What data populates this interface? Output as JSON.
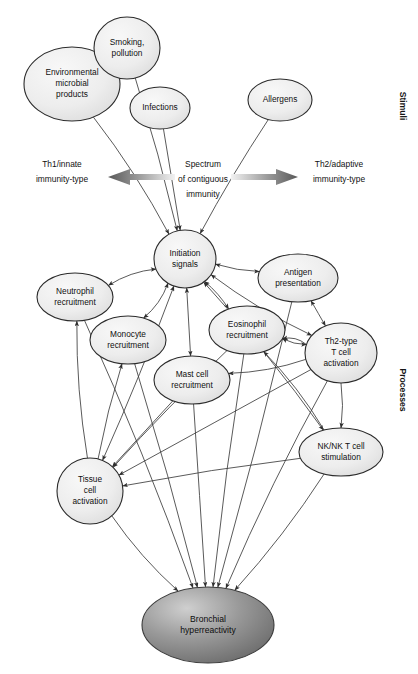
{
  "figure": {
    "background_color": "#ffffff",
    "node_fill": "#ececec",
    "node_stroke": "#2b2b2b",
    "outcome_fill_dark": "#6f6f6f",
    "outcome_fill_light": "#c9c9c9",
    "edge_color": "#3c3c3c"
  },
  "side_labels": {
    "stimuli": "Stimuli",
    "processes": "Processes"
  },
  "spectrum": {
    "left_label_line1": "Th1/innate",
    "left_label_line2": "immunity-type",
    "center_label_line1": "Spectrum",
    "center_label_line2": "of contiguous",
    "center_label_line3": "immunity",
    "right_label_line1": "Th2/adaptive",
    "right_label_line2": "immunity-type"
  },
  "nodes": {
    "environmental": {
      "lines": [
        "Environmental",
        "microbial",
        "products"
      ],
      "cx": 72,
      "cy": 84,
      "rx": 48,
      "ry": 37
    },
    "smoking": {
      "lines": [
        "Smoking,",
        "pollution"
      ],
      "cx": 127,
      "cy": 48,
      "rx": 33,
      "ry": 31
    },
    "infections": {
      "lines": [
        "Infections"
      ],
      "cx": 160,
      "cy": 108,
      "rx": 30,
      "ry": 21
    },
    "allergens": {
      "lines": [
        "Allergens"
      ],
      "cx": 280,
      "cy": 100,
      "rx": 32,
      "ry": 21
    },
    "initiation": {
      "lines": [
        "Initiation",
        "signals"
      ],
      "cx": 185,
      "cy": 259,
      "rx": 31,
      "ry": 29
    },
    "antigen": {
      "lines": [
        "Antigen",
        "presentation"
      ],
      "cx": 298,
      "cy": 278,
      "rx": 40,
      "ry": 24
    },
    "neutrophil": {
      "lines": [
        "Neutrophil",
        "recruitment"
      ],
      "cx": 75,
      "cy": 297,
      "rx": 38,
      "ry": 24
    },
    "monocyte": {
      "lines": [
        "Monocyte",
        "recruitment"
      ],
      "cx": 128,
      "cy": 340,
      "rx": 38,
      "ry": 24
    },
    "eosinophil": {
      "lines": [
        "Eosinophil",
        "recruitment"
      ],
      "cx": 247,
      "cy": 330,
      "rx": 38,
      "ry": 24
    },
    "mastcell": {
      "lines": [
        "Mast cell",
        "recruitment"
      ],
      "cx": 192,
      "cy": 380,
      "rx": 38,
      "ry": 24
    },
    "th2": {
      "lines": [
        "Th2-type",
        "T cell",
        "activation"
      ],
      "cx": 341,
      "cy": 353,
      "rx": 36,
      "ry": 30
    },
    "nknkt": {
      "lines": [
        "NK/NK T cell",
        "stimulation"
      ],
      "cx": 341,
      "cy": 452,
      "rx": 42,
      "ry": 24
    },
    "tissue": {
      "lines": [
        "Tissue",
        "cell",
        "activation"
      ],
      "cx": 90,
      "cy": 491,
      "rx": 33,
      "ry": 33
    },
    "bronchial": {
      "lines": [
        "Bronchial",
        "hyperreactivity"
      ],
      "cx": 208,
      "cy": 625,
      "rx": 66,
      "ry": 38
    }
  },
  "edges": [
    {
      "from": "environmental",
      "to": "initiation",
      "arrow": "end"
    },
    {
      "from": "smoking",
      "to": "initiation",
      "arrow": "end"
    },
    {
      "from": "infections",
      "to": "initiation",
      "arrow": "end"
    },
    {
      "from": "allergens",
      "to": "initiation",
      "arrow": "end"
    },
    {
      "from": "initiation",
      "to": "neutrophil",
      "arrow": "both"
    },
    {
      "from": "initiation",
      "to": "monocyte",
      "arrow": "both"
    },
    {
      "from": "initiation",
      "to": "eosinophil",
      "arrow": "both"
    },
    {
      "from": "initiation",
      "to": "mastcell",
      "arrow": "both"
    },
    {
      "from": "initiation",
      "to": "antigen",
      "arrow": "both"
    },
    {
      "from": "initiation",
      "to": "th2",
      "arrow": "both"
    },
    {
      "from": "initiation",
      "to": "nknkt",
      "arrow": "both"
    },
    {
      "from": "initiation",
      "to": "tissue",
      "arrow": "both"
    },
    {
      "from": "antigen",
      "to": "th2",
      "arrow": "both"
    },
    {
      "from": "eosinophil",
      "to": "th2",
      "arrow": "both"
    },
    {
      "from": "th2",
      "to": "eosinophil",
      "arrow": "end"
    },
    {
      "from": "th2",
      "to": "mastcell",
      "arrow": "end"
    },
    {
      "from": "th2",
      "to": "nknkt",
      "arrow": "end"
    },
    {
      "from": "th2",
      "to": "tissue",
      "arrow": "end"
    },
    {
      "from": "nknkt",
      "to": "tissue",
      "arrow": "end"
    },
    {
      "from": "nknkt",
      "to": "eosinophil",
      "arrow": "end"
    },
    {
      "from": "tissue",
      "to": "neutrophil",
      "arrow": "end"
    },
    {
      "from": "tissue",
      "to": "monocyte",
      "arrow": "end"
    },
    {
      "from": "mastcell",
      "to": "tissue",
      "arrow": "end"
    },
    {
      "from": "eosinophil",
      "to": "tissue",
      "arrow": "end"
    },
    {
      "from": "tissue",
      "to": "bronchial",
      "arrow": "end"
    },
    {
      "from": "neutrophil",
      "to": "bronchial",
      "arrow": "end"
    },
    {
      "from": "monocyte",
      "to": "bronchial",
      "arrow": "end"
    },
    {
      "from": "mastcell",
      "to": "bronchial",
      "arrow": "end"
    },
    {
      "from": "eosinophil",
      "to": "bronchial",
      "arrow": "end"
    },
    {
      "from": "th2",
      "to": "bronchial",
      "arrow": "end"
    },
    {
      "from": "nknkt",
      "to": "bronchial",
      "arrow": "end"
    },
    {
      "from": "antigen",
      "to": "bronchial",
      "arrow": "end"
    }
  ]
}
